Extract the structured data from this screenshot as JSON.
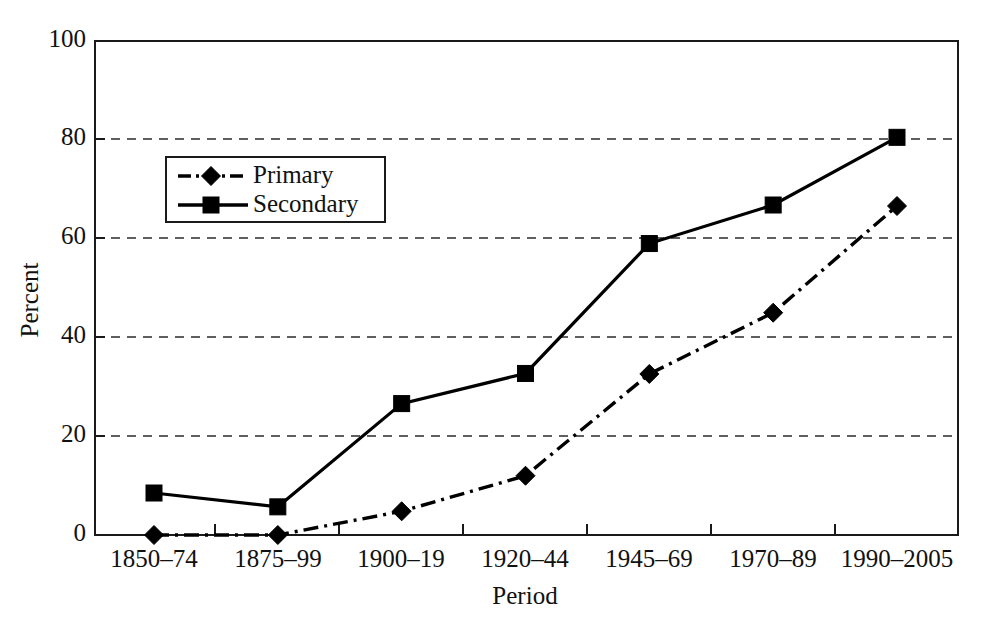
{
  "chart_data": {
    "type": "line",
    "title": "",
    "xlabel": "Period",
    "ylabel": "Percent",
    "categories": [
      "1850–74",
      "1875–99",
      "1900–19",
      "1920–44",
      "1945–69",
      "1970–89",
      "1990–2005"
    ],
    "series": [
      {
        "name": "Primary",
        "marker": "diamond",
        "linestyle": "dash-dot",
        "color": "#000000",
        "values": [
          0,
          0,
          4.8,
          12,
          32.6,
          45,
          66.6
        ]
      },
      {
        "name": "Secondary",
        "marker": "square",
        "linestyle": "solid",
        "color": "#000000",
        "values": [
          8.5,
          5.7,
          26.6,
          32.7,
          59,
          66.8,
          80.5
        ]
      }
    ],
    "ylim": [
      0,
      100
    ],
    "yticks": [
      0,
      20,
      40,
      60,
      80,
      100
    ],
    "ytick_labels": [
      "0",
      "20",
      "40",
      "60",
      "80",
      "100"
    ],
    "grid": "horizontal-dashed",
    "legend_position": "upper-left-inside",
    "background_color": "#ffffff",
    "frame_color": "#1a1a1a"
  },
  "axes": {
    "y_title": "Percent",
    "x_title": "Period"
  },
  "legend": {
    "entries": [
      {
        "label": "Primary"
      },
      {
        "label": "Secondary"
      }
    ]
  }
}
